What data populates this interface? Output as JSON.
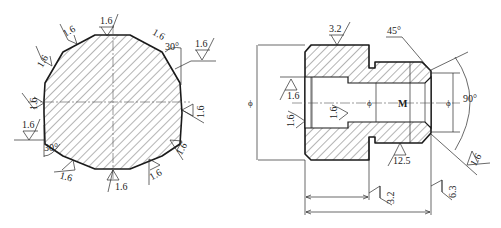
{
  "figure": {
    "left_view": {
      "name": "dodecagon-cross-section",
      "sides": 12,
      "roughness_labels": [
        "1.6",
        "1.6",
        "1.6",
        "1.6",
        "1.6",
        "1.6",
        "1.6",
        "1.6",
        "1.6",
        "1.6",
        "1.6",
        "1.6"
      ],
      "angle_top_right": "30°",
      "angle_bottom_left": "30°"
    },
    "right_view": {
      "name": "threaded-plug-section",
      "roughness_top": "3.2",
      "chamfer_angle": "45°",
      "cone_angle": "90°",
      "roughness_bore_left": "1.6",
      "roughness_face_left": "1.6",
      "roughness_counterbore": "1.6",
      "roughness_groove": "12.5",
      "roughness_chamfer": "1.6",
      "roughness_shoulder": "3.2",
      "roughness_end": "6.3",
      "thread_label": "M",
      "diameter_symbol_outer": "ϕ",
      "diameter_symbol_bore": "ϕ",
      "diameter_symbol_end": "ϕ"
    }
  },
  "colors": {
    "line": "#1a1a1a",
    "background": "#ffffff"
  }
}
